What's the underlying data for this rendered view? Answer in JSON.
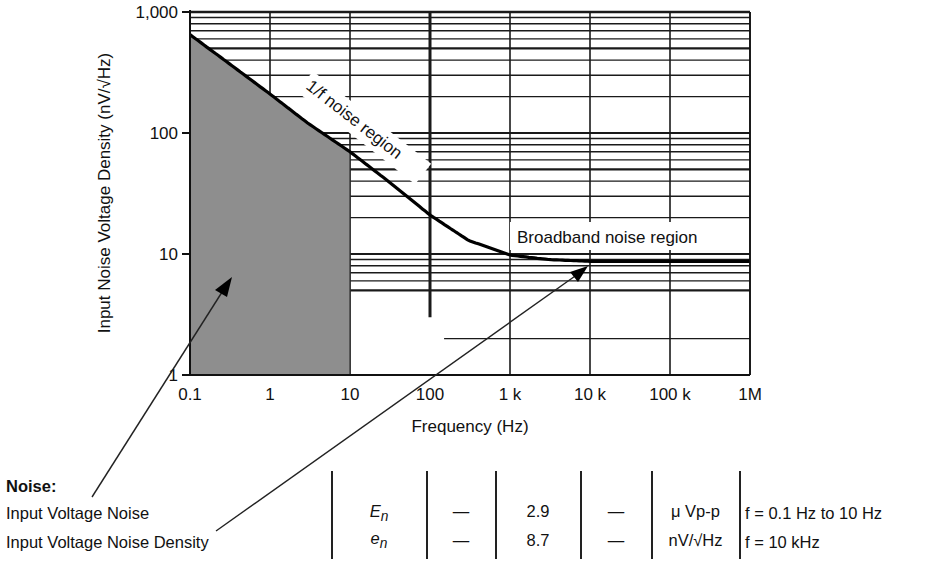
{
  "chart_data": {
    "type": "line",
    "title": "",
    "xlabel": "Frequency (Hz)",
    "ylabel": "Input Noise Voltage Density (nV/√Hz)",
    "xscale": "log",
    "yscale": "log",
    "xlim": [
      0.1,
      1000000
    ],
    "ylim": [
      1,
      1000
    ],
    "grid": true,
    "x_ticks": [
      "0.1",
      "1",
      "10",
      "100",
      "1 k",
      "10 k",
      "100 k",
      "1M"
    ],
    "y_ticks": [
      "1",
      "10",
      "100",
      "1,000"
    ],
    "series": [
      {
        "name": "Input noise voltage density",
        "x": [
          0.1,
          0.3,
          1,
          3,
          10,
          30,
          100,
          300,
          1000,
          3000,
          10000,
          100000,
          1000000
        ],
        "values": [
          650,
          380,
          210,
          120,
          70,
          40,
          21,
          13,
          9.8,
          9.0,
          8.7,
          8.7,
          8.7
        ]
      }
    ],
    "shaded_region": {
      "x_from": 0.1,
      "x_to": 10,
      "label": "0.1 Hz to 10 Hz peak-to-peak noise band"
    },
    "annotations": [
      {
        "text": "1/f noise region",
        "x": 3,
        "y": 200,
        "rotation": 38
      },
      {
        "text": "Broadband noise region",
        "x": 10000,
        "y": 13
      }
    ]
  },
  "spec_table": {
    "heading": "Noise:",
    "rows": [
      {
        "parameter": "Input Voltage Noise",
        "symbol": "E",
        "symbol_sub": "n",
        "min": "—",
        "typ": "2.9",
        "max": "—",
        "unit": "μ Vp-p",
        "condition": "f = 0.1 Hz to 10 Hz"
      },
      {
        "parameter": "Input Voltage Noise Density",
        "symbol": "e",
        "symbol_sub": "n",
        "min": "—",
        "typ": "8.7",
        "max": "—",
        "unit": "nV/√Hz",
        "condition": "f = 10 kHz"
      }
    ]
  },
  "colors": {
    "ink": "#111111",
    "shade": "#8e8e8e",
    "grid": "#1a1a1a",
    "background": "#ffffff"
  }
}
